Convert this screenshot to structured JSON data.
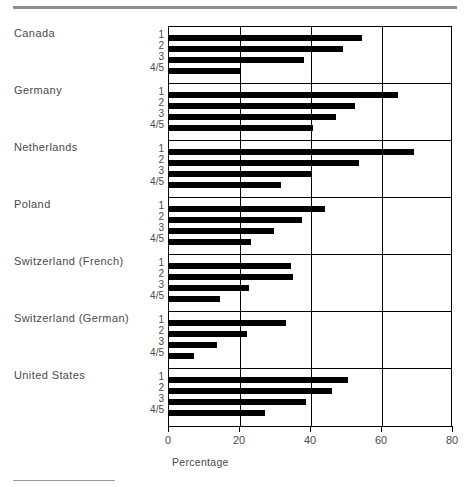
{
  "chart_data": {
    "type": "bar",
    "orientation": "horizontal",
    "title": "",
    "xlabel": "Percentage",
    "ylabel": "",
    "xlim": [
      0,
      80
    ],
    "xticks": [
      0,
      20,
      40,
      60,
      80
    ],
    "xtick_labels": [
      "0",
      "20",
      "40",
      "60",
      "80"
    ],
    "grid": true,
    "grid_axis": "x",
    "legend": "none",
    "categories": [
      "1",
      "2",
      "3",
      "4/5"
    ],
    "groups": [
      {
        "name": "Canada",
        "values": [
          54.5,
          49.0,
          38.0,
          20.0
        ]
      },
      {
        "name": "Germany",
        "values": [
          64.5,
          52.5,
          47.0,
          40.5
        ]
      },
      {
        "name": "Netherlands",
        "values": [
          69.0,
          53.5,
          40.0,
          31.5
        ]
      },
      {
        "name": "Poland",
        "values": [
          44.0,
          37.5,
          29.5,
          23.0
        ]
      },
      {
        "name": "Switzerland (French)",
        "values": [
          34.5,
          35.0,
          22.5,
          14.5
        ]
      },
      {
        "name": "Switzerland (German)",
        "values": [
          33.0,
          22.0,
          13.5,
          7.0
        ]
      },
      {
        "name": "United States",
        "values": [
          50.5,
          46.0,
          38.5,
          27.0
        ]
      }
    ],
    "bar_color": "#000000",
    "axis_color": "#000000",
    "text_color": "#4a4a4a"
  },
  "axis": {
    "xlabel": "Percentage",
    "ticks": [
      "0",
      "20",
      "40",
      "60",
      "80"
    ]
  },
  "groups": [
    {
      "name": "Canada"
    },
    {
      "name": "Germany"
    },
    {
      "name": "Netherlands"
    },
    {
      "name": "Poland"
    },
    {
      "name": "Switzerland (French)"
    },
    {
      "name": "Switzerland (German)"
    },
    {
      "name": "United States"
    }
  ],
  "categories": [
    "1",
    "2",
    "3",
    "4/5"
  ]
}
